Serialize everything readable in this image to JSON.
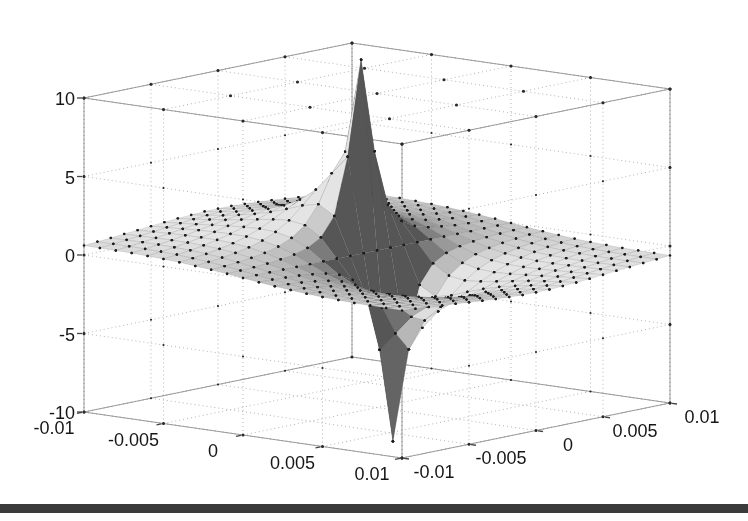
{
  "page": {
    "background": "#ffffff"
  },
  "figure": {
    "type": "3d-surface-plot",
    "title": "",
    "bottom_rule_color": "#3b3b3b",
    "bottom_rule_top": 504,
    "bottom_rule_height": 9
  },
  "chart_data": {
    "type": "surface",
    "title": "",
    "xlabel": "",
    "ylabel": "",
    "zlabel": "",
    "grid": true,
    "legend": null,
    "x_axis": {
      "range": [
        -0.01,
        0.01
      ],
      "ticks": [
        -0.01,
        -0.005,
        0,
        0.005,
        0.01
      ],
      "tick_labels": [
        "-0.01",
        "-0.005",
        "0",
        "0.005",
        "0.01"
      ]
    },
    "y_axis": {
      "range": [
        -0.01,
        0.01
      ],
      "ticks": [
        -0.01,
        -0.005,
        0,
        0.005,
        0.01
      ],
      "tick_labels": [
        "-0.01",
        "-0.005",
        "0",
        "0.005",
        "0.01"
      ]
    },
    "z_axis": {
      "range": [
        -10,
        10
      ],
      "ticks": [
        -10,
        -5,
        0,
        5,
        10
      ],
      "tick_labels": [
        "-10",
        "-5",
        "0",
        "5",
        "10"
      ]
    },
    "surface": {
      "formula": "z(x,y) = -k*x/(x^2+y^2)",
      "k": 0.012,
      "grid_points": 21,
      "z_peak": 12,
      "z_dip": -12,
      "peak_location": [
        -0.001,
        0
      ],
      "dip_location": [
        0.001,
        0
      ],
      "markers": "black dot at every mesh vertex",
      "z_samples_at_ticks": [
        [
          0.6,
          0.96,
          1.2,
          0.96,
          0.6
        ],
        [
          0.48,
          1.2,
          2.4,
          1.2,
          0.48
        ],
        [
          0,
          0,
          0,
          0,
          0
        ],
        [
          -0.48,
          -1.2,
          -2.4,
          -1.2,
          -0.48
        ],
        [
          -0.6,
          -0.96,
          -1.2,
          -0.96,
          -0.6
        ]
      ]
    },
    "style": {
      "surface_base_gray": "#d5d5d5",
      "dark_face_gray": "#565656",
      "marker_color": "#1c1c1c",
      "grid_line_color": "#b3b3b3",
      "box_edge_color": "#9a9a9a",
      "tick_color": "#444444",
      "tick_label_color": "#161616",
      "tick_label_font_size": 18
    }
  }
}
